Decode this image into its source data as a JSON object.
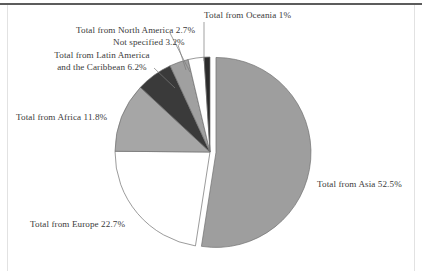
{
  "chart_data": {
    "type": "pie",
    "title": "",
    "subtitle": "",
    "xlabel": "",
    "ylabel": "",
    "legend_position": "none",
    "grid": false,
    "unit": "%",
    "start_angle_deg": 0,
    "direction": "clockwise",
    "categories": [
      "Total from Asia",
      "Total from Europe",
      "Total from Africa",
      "Total from Latin America and the Caribbean",
      "Not specified",
      "Total from North America",
      "Total from Oceania"
    ],
    "values": [
      52.5,
      22.7,
      11.8,
      6.2,
      3.2,
      2.7,
      1.0
    ],
    "slices": [
      {
        "name": "Total from Asia",
        "label": "Total from Asia  52.5%",
        "value": 52.5,
        "value_text": "52.5%",
        "color": "#9e9e9e",
        "exploded": true
      },
      {
        "name": "Total from Europe",
        "label": "Total from Europe  22.7%",
        "value": 22.7,
        "value_text": "22.7%",
        "color": "#ffffff",
        "exploded": false
      },
      {
        "name": "Total from Africa",
        "label": "Total from Africa  11.8%",
        "value": 11.8,
        "value_text": "11.8%",
        "color": "#a6a6a6",
        "exploded": false
      },
      {
        "name": "Total from Latin America and the Caribbean",
        "label_line1": "Total from Latin America",
        "label_line2": "and the Caribbean  6.2%",
        "value": 6.2,
        "value_text": "6.2%",
        "color": "#3a3a3a",
        "exploded": false
      },
      {
        "name": "Not specified",
        "label": "Not specified  3.2%",
        "value": 3.2,
        "value_text": "3.2%",
        "color": "#a0a0a0",
        "exploded": false
      },
      {
        "name": "Total from North America",
        "label": "Total from North America  2.7%",
        "value": 2.7,
        "value_text": "2.7%",
        "color": "#ffffff",
        "exploded": false
      },
      {
        "name": "Total from Oceania",
        "label": "Total from Oceania  1%",
        "value": 1.0,
        "value_text": "1%",
        "color": "#2b2b2b",
        "exploded": false
      }
    ]
  },
  "colors": {
    "page_background": "#ffffff",
    "text": "#3a3a3a",
    "rule": "#5c5c5c",
    "frame": "#e2e2e2",
    "slice_outline": "#707070"
  }
}
